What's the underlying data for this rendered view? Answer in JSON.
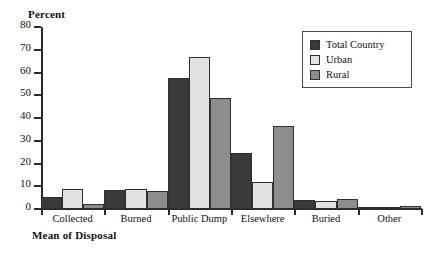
{
  "chart_data": {
    "type": "bar",
    "title": "",
    "subtitle": "",
    "xlabel": "Mean of Disposal",
    "ylabel": "Percent",
    "ylim": [
      0,
      80
    ],
    "ytick_step": 10,
    "yticks": [
      80,
      70,
      60,
      50,
      40,
      30,
      20,
      10,
      0
    ],
    "grid": false,
    "legend_position": "top-right",
    "categories": [
      "Collected",
      "Burned",
      "Public Dump",
      "Elsewhere",
      "Buried",
      "Other"
    ],
    "series": [
      {
        "name": "Total Country",
        "color": "#3a3a3a",
        "values": [
          5.5,
          8.3,
          57.5,
          24.8,
          4.0,
          1.0
        ]
      },
      {
        "name": "Urban",
        "color": "#e2e2e2",
        "values": [
          9.0,
          8.7,
          67.0,
          11.8,
          3.7,
          0.7
        ]
      },
      {
        "name": "Rural",
        "color": "#8d8d8d",
        "values": [
          2.0,
          8.0,
          49.0,
          36.5,
          4.2,
          1.2
        ]
      }
    ]
  },
  "legend": {
    "items": [
      {
        "label": "Total Country"
      },
      {
        "label": "Urban"
      },
      {
        "label": "Rural"
      }
    ]
  },
  "colors": {
    "total_country": "#3a3a3a",
    "urban": "#e2e2e2",
    "rural": "#8d8d8d",
    "axis": "#2b2b2b",
    "background": "#ffffff"
  }
}
